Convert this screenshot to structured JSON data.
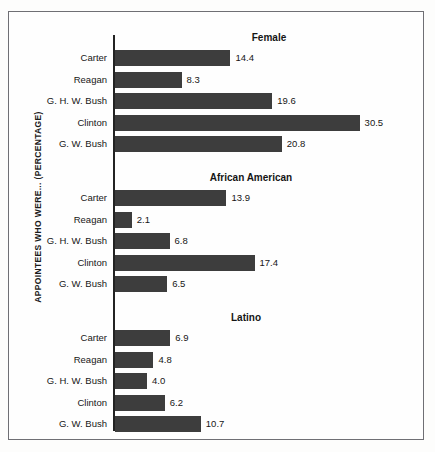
{
  "figure": {
    "top_cropped_text": "FROM THE SHADOWS",
    "y_axis_label": "APPOINTEES WHO WERE... (PERCENTAGE)",
    "bar_color": "#3d3d3d",
    "frame_color": "#6f6f74",
    "text_color": "#161616"
  },
  "chart_data": {
    "type": "bar",
    "orientation": "horizontal",
    "title": "",
    "xlabel": "",
    "ylabel": "APPOINTEES WHO WERE... (PERCENTAGE)",
    "xlim": [
      0,
      30.5
    ],
    "grid": false,
    "legend": "none",
    "categories": [
      "Carter",
      "Reagan",
      "G. H. W. Bush",
      "Clinton",
      "G. W. Bush"
    ],
    "panels": [
      {
        "title": "Female",
        "title_center_x": 268,
        "categories": [
          "Carter",
          "Reagan",
          "G. H. W. Bush",
          "Clinton",
          "G. W. Bush"
        ],
        "values": [
          14.4,
          8.3,
          19.6,
          30.5,
          20.8
        ],
        "labels": [
          "14.4",
          "8.3",
          "19.6",
          "30.5",
          "20.8"
        ]
      },
      {
        "title": "African American",
        "title_center_x": 250,
        "categories": [
          "Carter",
          "Reagan",
          "G. H. W. Bush",
          "Clinton",
          "G. W. Bush"
        ],
        "values": [
          13.9,
          2.1,
          6.8,
          17.4,
          6.5
        ],
        "labels": [
          "13.9",
          "2.1",
          "6.8",
          "17.4",
          "6.5"
        ]
      },
      {
        "title": "Latino",
        "title_center_x": 245,
        "categories": [
          "Carter",
          "Reagan",
          "G. H. W. Bush",
          "Clinton",
          "G. W. Bush"
        ],
        "values": [
          6.9,
          4.8,
          4.0,
          6.2,
          10.7
        ],
        "labels": [
          "6.9",
          "4.8",
          "4.0",
          "6.2",
          "10.7"
        ]
      }
    ]
  }
}
